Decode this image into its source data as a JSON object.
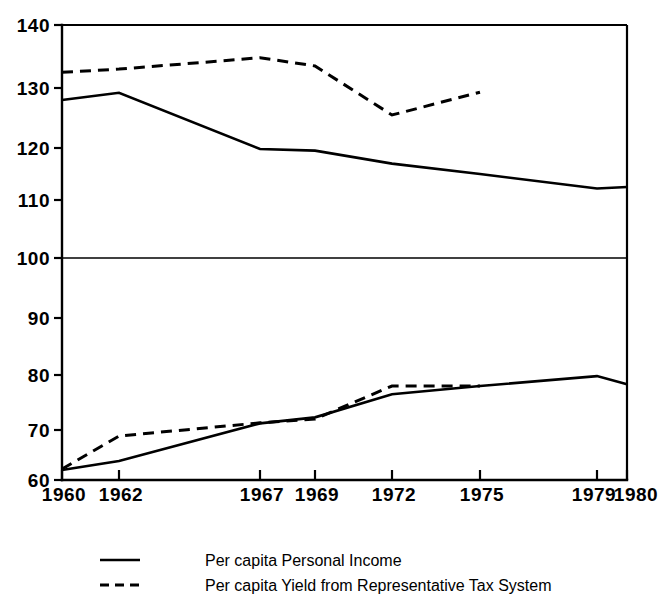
{
  "chart_data": {
    "type": "line",
    "title": "",
    "subtitle": "",
    "xlabel": "",
    "ylabel": "",
    "xlim": [
      1960,
      1980
    ],
    "ylim": [
      60,
      140
    ],
    "grid": false,
    "legend_position": "bottom",
    "reference_line": {
      "value": 100,
      "label": "100"
    },
    "x_tick_labels": [
      "1960",
      "1962",
      "1967",
      "1969",
      "1972",
      "1975",
      "1979",
      "1980"
    ],
    "x_tick_values": [
      1960,
      1962,
      1967,
      1969,
      1972,
      1975,
      1979,
      1980
    ],
    "y_tick_labels": [
      "140",
      "130",
      "120",
      "110",
      "100",
      "90",
      "80",
      "70",
      "60"
    ],
    "y_tick_values": [
      140,
      130,
      120,
      110,
      100,
      90,
      80,
      70,
      60
    ],
    "series": [
      {
        "name": "Per capita Personal Income",
        "style": "solid",
        "group": "upper",
        "x": [
          1960,
          1962,
          1967,
          1969,
          1972,
          1975,
          1979,
          1980
        ],
        "values": [
          128.0,
          129.2,
          119.8,
          119.5,
          117.0,
          115.0,
          112.2,
          112.5
        ]
      },
      {
        "name": "Per capita Yield from Representative Tax System",
        "style": "dashed",
        "group": "upper",
        "x": [
          1960,
          1962,
          1967,
          1969,
          1972,
          1975
        ],
        "values": [
          132.5,
          133.0,
          134.8,
          133.5,
          125.5,
          129.3
        ]
      },
      {
        "name": "Per capita Personal Income",
        "style": "solid",
        "group": "lower",
        "x": [
          1960,
          1962,
          1967,
          1969,
          1972,
          1975,
          1979,
          1980
        ],
        "values": [
          62.0,
          63.8,
          71.2,
          72.3,
          76.5,
          78.0,
          79.8,
          78.3
        ]
      },
      {
        "name": "Per capita Yield from Representative Tax System",
        "style": "dashed",
        "group": "lower",
        "x": [
          1960,
          1962,
          1967,
          1969,
          1972,
          1975
        ],
        "values": [
          62.2,
          68.8,
          71.3,
          72.0,
          78.0,
          78.0
        ]
      }
    ],
    "legend": [
      {
        "label": "Per capita Personal Income",
        "style": "solid"
      },
      {
        "label": "Per capita Yield from Representative Tax System",
        "style": "dashed"
      }
    ]
  },
  "axes": {
    "y_ticks": [
      {
        "label": "140",
        "value": 140
      },
      {
        "label": "130",
        "value": 130
      },
      {
        "label": "120",
        "value": 120
      },
      {
        "label": "110",
        "value": 110
      },
      {
        "label": "100",
        "value": 100
      },
      {
        "label": "90",
        "value": 90
      },
      {
        "label": "80",
        "value": 80
      },
      {
        "label": "70",
        "value": 70
      },
      {
        "label": "60",
        "value": 60
      }
    ],
    "x_ticks": [
      {
        "label": "1960",
        "value": 1960
      },
      {
        "label": "1962",
        "value": 1962
      },
      {
        "label": "1967",
        "value": 1967
      },
      {
        "label": "1969",
        "value": 1969
      },
      {
        "label": "1972",
        "value": 1972
      },
      {
        "label": "1975",
        "value": 1975
      },
      {
        "label": "1979",
        "value": 1979
      },
      {
        "label": "1980",
        "value": 1980
      }
    ]
  },
  "legend": {
    "entries": [
      {
        "label": "Per capita Personal Income",
        "style": "solid"
      },
      {
        "label": "Per capita Yield from Representative Tax System",
        "style": "dashed"
      }
    ]
  },
  "colors": {
    "foreground": "#000000",
    "background": "#ffffff"
  }
}
